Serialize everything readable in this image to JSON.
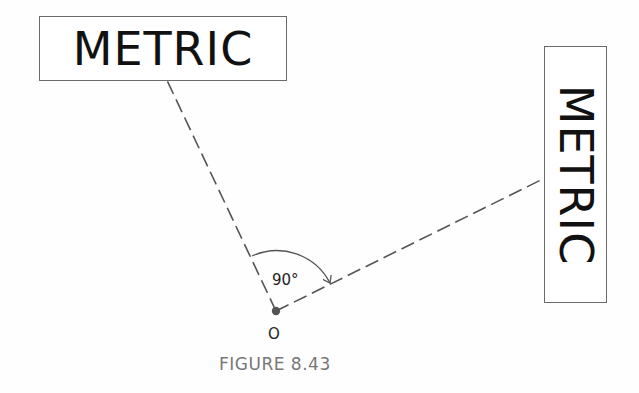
{
  "figure": {
    "caption": "FIGURE 8.43",
    "labels": {
      "horizontal_box_text": "METRIC",
      "vertical_box_text": "METRIC",
      "angle_text": "90°",
      "origin_text": "O"
    },
    "geometry": {
      "origin_point": [
        276,
        311
      ],
      "left_ray_end": [
        164,
        74
      ],
      "right_ray_end": [
        555,
        173
      ],
      "angle_degrees": 90,
      "arc_radius": 60
    },
    "colors": {
      "line": "#555555",
      "text": "#111111",
      "caption": "#777777",
      "box_border": "#6a6a6a",
      "point": "#555555"
    }
  }
}
